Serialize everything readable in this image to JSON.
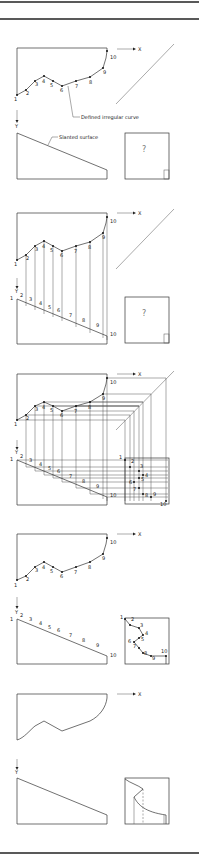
{
  "figure": {
    "x_axis_label": "X",
    "y_axis_label": "Y",
    "point_labels": [
      "1",
      "2",
      "3",
      "4",
      "5",
      "6",
      "7",
      "8",
      "9",
      "10"
    ],
    "unknown_marker": "?",
    "annotations": {
      "defined_curve": "Defined irregular curve",
      "slanted_surface": "Slanted surface"
    },
    "steps": [
      {
        "step": 1,
        "description": "Top view with defined irregular curve and front view with slanted surface; side view unknown"
      },
      {
        "step": 2,
        "description": "Points projected from top view down to slanted surface in front view"
      },
      {
        "step": 3,
        "description": "Points projected via 45° miter line and from front view into side view"
      },
      {
        "step": 4,
        "description": "Points located in side view"
      },
      {
        "step": 5,
        "description": "Completed views with curve drawn in side view"
      }
    ]
  }
}
